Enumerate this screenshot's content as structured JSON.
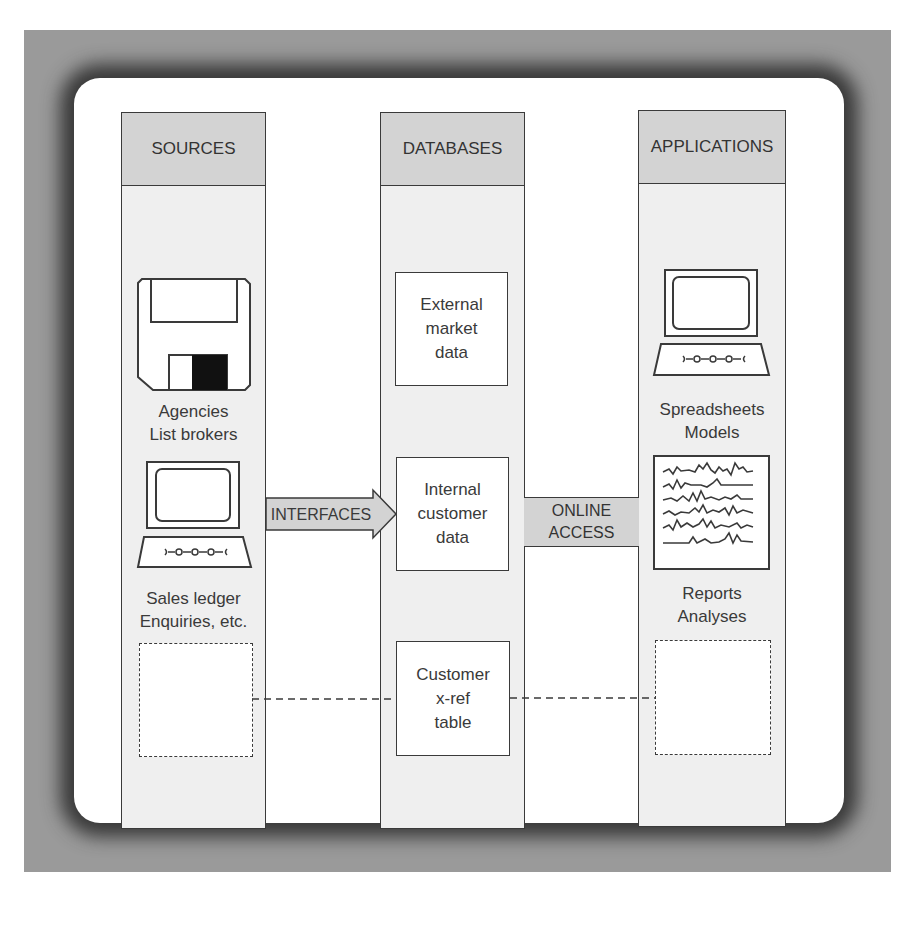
{
  "diagram": {
    "columns": [
      {
        "id": "sources",
        "title": "SOURCES"
      },
      {
        "id": "databases",
        "title": "DATABASES"
      },
      {
        "id": "applications",
        "title": "APPLICATIONS"
      }
    ],
    "sources": {
      "icons": [
        "floppy-disk-icon",
        "computer-terminal-icon"
      ],
      "labels": [
        "Agencies\nList brokers",
        "Sales ledger\nEnquiries, etc."
      ]
    },
    "databases": {
      "boxes": [
        "External\nmarket\ndata",
        "Internal\ncustomer\ndata",
        "Customer\nx-ref\ntable"
      ]
    },
    "applications": {
      "icons": [
        "computer-terminal-icon",
        "report-chart-icon"
      ],
      "labels": [
        "Spreadsheets\nModels",
        "Reports\nAnalyses"
      ]
    },
    "connectors": {
      "interfaces": "INTERFACES",
      "online_access": "ONLINE\nACCESS"
    },
    "colors": {
      "frame": "#9a9a9a",
      "column_body": "#efefef",
      "column_header": "#d3d3d3",
      "stroke": "#3a3a3a"
    }
  }
}
